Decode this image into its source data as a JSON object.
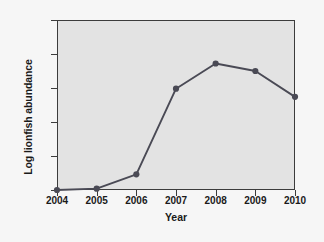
{
  "chart_data": {
    "type": "line",
    "title": "",
    "xlabel": "Year",
    "ylabel": "Log lionfish abundance",
    "x": [
      2004,
      2005,
      2006,
      2007,
      2008,
      2009,
      2010
    ],
    "xtick_labels": [
      "2004",
      "2005",
      "2006",
      "2007",
      "2008",
      "2009",
      "2010"
    ],
    "values": [
      0.0,
      0.02,
      0.23,
      1.49,
      1.86,
      1.75,
      1.37
    ],
    "ytick_labels": [
      "0.0",
      "0.5",
      "1.0",
      "1.5",
      "2.0",
      "2.5"
    ],
    "ytick_values": [
      0.0,
      0.5,
      1.0,
      1.5,
      2.0,
      2.5
    ],
    "xlim": [
      2004,
      2010
    ],
    "ylim": [
      0.0,
      2.5
    ],
    "grid": false,
    "legend": null,
    "series": [
      {
        "name": "Log lionfish abundance",
        "values": [
          0.0,
          0.02,
          0.23,
          1.49,
          1.86,
          1.75,
          1.37
        ],
        "marker": "circle",
        "line_color": "#4a4a55",
        "marker_color": "#4a4a55"
      }
    ],
    "colors": {
      "plot_background": "#e3e3e3",
      "figure_background": "#f6f6f6",
      "axis": "#3c3c3c",
      "text": "#1a1a1a",
      "series": "#4a4a55"
    }
  }
}
